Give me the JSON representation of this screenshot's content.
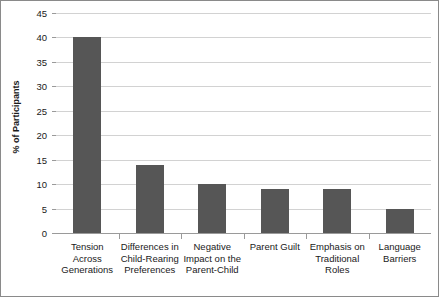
{
  "chart_data": {
    "type": "bar",
    "title": "",
    "subtitle": "",
    "xlabel": "",
    "ylabel": "% of Participants",
    "ylim": [
      0,
      45
    ],
    "ytick_step": 5,
    "yticks": [
      0,
      5,
      10,
      15,
      20,
      25,
      30,
      35,
      40,
      45
    ],
    "ytick_labels": [
      "0",
      "5",
      "10",
      "15",
      "20",
      "25",
      "30",
      "35",
      "40",
      "45"
    ],
    "grid": "horizontal",
    "legend": "none",
    "categories": [
      "Tension Across Generations",
      "Differences in Child-Rearing Preferences",
      "Negative Impact on the Parent-Child",
      "Parent Guilt",
      "Emphasis on Traditional Roles",
      "Language Barriers"
    ],
    "category_lines": [
      [
        "Tension Across",
        "Generations"
      ],
      [
        "Differences in",
        "Child-Rearing",
        "Preferences"
      ],
      [
        "Negative",
        "Impact on the",
        "Parent-Child"
      ],
      [
        "Parent Guilt"
      ],
      [
        "Emphasis on",
        "Traditional",
        "Roles"
      ],
      [
        "Language",
        "Barriers"
      ]
    ],
    "values": [
      40,
      14,
      10,
      9,
      9,
      5
    ],
    "bar_color": "#565656",
    "gridline_color": "#d2d2d2",
    "axis_color": "#9a9a9a",
    "background_color": "#ffffff",
    "border_color": "#8a8a8a"
  }
}
